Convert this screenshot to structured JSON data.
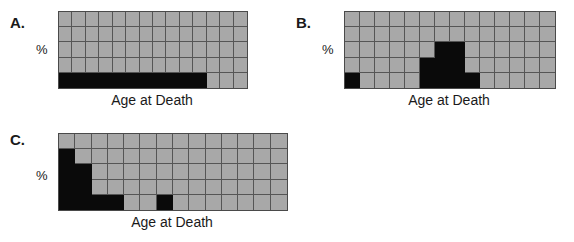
{
  "figure": {
    "background_color": "#ffffff",
    "grid_fill_color": "#a8a8a8",
    "bar_color": "#0a0a0a",
    "gridline_color": "#555555"
  },
  "panels": [
    {
      "id": "panel-a",
      "letter": "A.",
      "y_axis_label": "%",
      "x_axis_label": "Age at Death",
      "columns": 14,
      "rows": 5,
      "chart_data": {
        "type": "bar",
        "title": "A.",
        "xlabel": "Age at Death",
        "ylabel": "%",
        "categories": [
          "1",
          "2",
          "3",
          "4",
          "5",
          "6",
          "7",
          "8",
          "9",
          "10",
          "11",
          "12",
          "13",
          "14"
        ],
        "values": [
          1,
          1,
          1,
          1,
          1,
          1,
          1,
          1,
          1,
          1,
          1,
          0,
          0,
          0
        ],
        "ylim": [
          0,
          5
        ],
        "grid": true,
        "legend": "none",
        "description": "Uniform low bar across most age categories"
      }
    },
    {
      "id": "panel-b",
      "letter": "B.",
      "y_axis_label": "%",
      "x_axis_label": "Age at Death",
      "columns": 14,
      "rows": 5,
      "chart_data": {
        "type": "bar",
        "title": "B.",
        "xlabel": "Age at Death",
        "ylabel": "%",
        "categories": [
          "1",
          "2",
          "3",
          "4",
          "5",
          "6",
          "7",
          "8",
          "9",
          "10",
          "11",
          "12",
          "13",
          "14"
        ],
        "values": [
          1,
          0,
          0,
          0,
          0,
          2,
          3,
          3,
          1,
          0,
          0,
          0,
          0,
          0
        ],
        "ylim": [
          0,
          5
        ],
        "grid": true,
        "legend": "none",
        "description": "Single low bar at left plus a centered peak"
      }
    },
    {
      "id": "panel-c",
      "letter": "C.",
      "y_axis_label": "%",
      "x_axis_label": "Age at Death",
      "columns": 14,
      "rows": 5,
      "chart_data": {
        "type": "bar",
        "title": "C.",
        "xlabel": "Age at Death",
        "ylabel": "%",
        "categories": [
          "1",
          "2",
          "3",
          "4",
          "5",
          "6",
          "7",
          "8",
          "9",
          "10",
          "11",
          "12",
          "13",
          "14"
        ],
        "values": [
          4,
          3,
          1,
          1,
          0,
          0,
          1,
          0,
          0,
          0,
          0,
          0,
          0,
          0
        ],
        "ylim": [
          0,
          5
        ],
        "grid": true,
        "legend": "none",
        "description": "Descending staircase from the left with one isolated bar"
      }
    }
  ]
}
